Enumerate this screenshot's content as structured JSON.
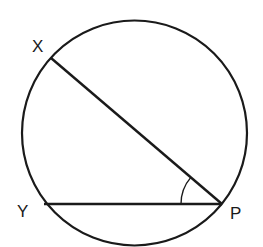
{
  "diagram": {
    "type": "circle-geometry",
    "stroke_color": "#1a1a1a",
    "background": "#ffffff",
    "circle": {
      "cx": 134.5,
      "cy": 133,
      "r": 112.5
    },
    "points": {
      "X": {
        "label": "X",
        "x": 51,
        "y": 58,
        "label_x": 32,
        "label_y": 52
      },
      "Y": {
        "label": "Y",
        "x": 44,
        "y": 204,
        "label_x": 17,
        "label_y": 217
      },
      "P": {
        "label": "P",
        "x": 222,
        "y": 204,
        "label_x": 230,
        "label_y": 219
      }
    },
    "segments": [
      {
        "from": "X",
        "to": "P"
      },
      {
        "from": "Y",
        "to": "P"
      }
    ],
    "angle_marker": {
      "vertex": "P",
      "between": [
        "Y",
        "X"
      ],
      "radius": 41
    }
  }
}
